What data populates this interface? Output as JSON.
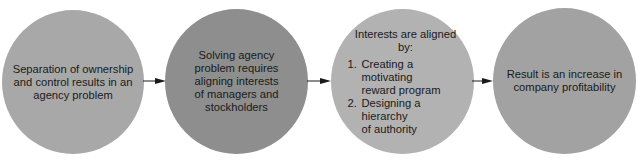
{
  "diagram": {
    "nodes": [
      {
        "id": "separation",
        "text": "Separation of ownership and control results in an agency problem",
        "lines": [
          "Separation of ownership",
          "and control results in an",
          "agency problem"
        ],
        "color": "#a8a8a8"
      },
      {
        "id": "solving",
        "text": "Solving agency problem requires aligning interests of managers and stockholders",
        "lines": [
          "Solving agency",
          "problem requires",
          "aligning interests",
          "of managers and",
          "stockholders"
        ],
        "color": "#8e8e8e"
      },
      {
        "id": "aligned",
        "heading": "Interests are aligned by:",
        "items": [
          {
            "num": "1.",
            "lines": [
              "Creating a motivating",
              "reward program"
            ]
          },
          {
            "num": "2.",
            "lines": [
              "Designing a hierarchy",
              "of authority"
            ]
          }
        ],
        "color": "#b2b2b2"
      },
      {
        "id": "result",
        "text": "Result is an increase in company profitability",
        "lines": [
          "Result is an increase in",
          "company profitability"
        ],
        "color": "#a2a2a2"
      }
    ],
    "edges": [
      {
        "from": "separation",
        "to": "solving"
      },
      {
        "from": "solving",
        "to": "aligned"
      },
      {
        "from": "aligned",
        "to": "result"
      }
    ],
    "arrow_color": "#1a1a1a"
  }
}
